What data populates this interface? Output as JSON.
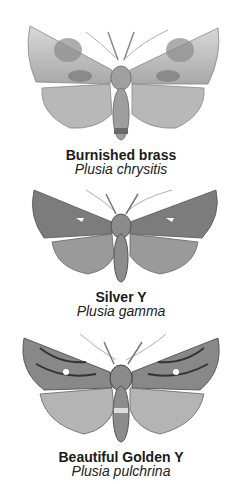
{
  "plates": [
    {
      "common_name": "Burnished brass",
      "latin_name": "Plusia chrysitis"
    },
    {
      "common_name": "Silver Y",
      "latin_name": "Plusia gamma"
    },
    {
      "common_name": "Beautiful Golden Y",
      "latin_name": "Plusia pulchrina"
    }
  ],
  "colors": {
    "background": "#ffffff",
    "text": "#1a1a1a"
  }
}
